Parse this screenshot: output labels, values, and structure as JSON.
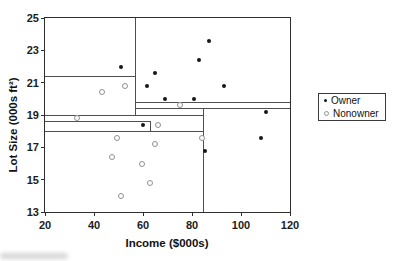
{
  "chart_data": {
    "type": "scatter",
    "title": "",
    "xlabel": "Income ($000s)",
    "ylabel": "Lot Size (000s ft²)",
    "xlim": [
      20,
      120
    ],
    "ylim": [
      13,
      25
    ],
    "xticks": [
      20,
      40,
      60,
      80,
      100,
      120
    ],
    "yticks": [
      25,
      23,
      21,
      19,
      17,
      15,
      13
    ],
    "grid": "off",
    "legend": {
      "position": "right-outside",
      "entries": [
        {
          "label": "Owner",
          "marker": "filled-dot",
          "color": "#161616"
        },
        {
          "label": "Nonowner",
          "marker": "open-circle",
          "color": "#929292"
        }
      ]
    },
    "series": [
      {
        "name": "Owner",
        "marker": "filled-dot",
        "points": [
          [
            51.0,
            22.0
          ],
          [
            60.0,
            18.4
          ],
          [
            61.5,
            20.8
          ],
          [
            64.8,
            21.6
          ],
          [
            69.0,
            20.0
          ],
          [
            81.0,
            20.0
          ],
          [
            82.8,
            22.4
          ],
          [
            85.5,
            16.8
          ],
          [
            87.0,
            23.6
          ],
          [
            93.0,
            20.8
          ],
          [
            108.0,
            17.6
          ],
          [
            110.1,
            19.2
          ]
        ]
      },
      {
        "name": "Nonowner",
        "marker": "open-circle",
        "points": [
          [
            33.0,
            18.8
          ],
          [
            43.2,
            20.4
          ],
          [
            47.4,
            16.4
          ],
          [
            49.2,
            17.6
          ],
          [
            51.0,
            14.0
          ],
          [
            52.8,
            20.8
          ],
          [
            59.4,
            16.0
          ],
          [
            63.0,
            14.8
          ],
          [
            64.8,
            17.2
          ],
          [
            66.0,
            18.4
          ],
          [
            75.0,
            19.6
          ],
          [
            84.0,
            17.6
          ]
        ]
      }
    ],
    "partition_lines": [
      {
        "orientation": "vertical",
        "income": 57.0,
        "lot_min": 19.0,
        "lot_max": 25.0
      },
      {
        "orientation": "horizontal",
        "lot": 21.4,
        "income_min": 20.0,
        "income_max": 57.0
      },
      {
        "orientation": "horizontal",
        "lot": 19.8,
        "income_min": 57.0,
        "income_max": 120.0
      },
      {
        "orientation": "horizontal",
        "lot": 19.4,
        "income_min": 57.0,
        "income_max": 120.0
      },
      {
        "orientation": "vertical",
        "income": 84.75,
        "lot_min": 13.0,
        "lot_max": 19.4
      },
      {
        "orientation": "horizontal",
        "lot": 19.0,
        "income_min": 20.0,
        "income_max": 84.75
      },
      {
        "orientation": "horizontal",
        "lot": 18.6,
        "income_min": 20.0,
        "income_max": 63.0
      },
      {
        "orientation": "vertical",
        "income": 63.0,
        "lot_min": 18.0,
        "lot_max": 18.6
      },
      {
        "orientation": "horizontal",
        "lot": 18.0,
        "income_min": 20.0,
        "income_max": 84.75
      }
    ]
  }
}
